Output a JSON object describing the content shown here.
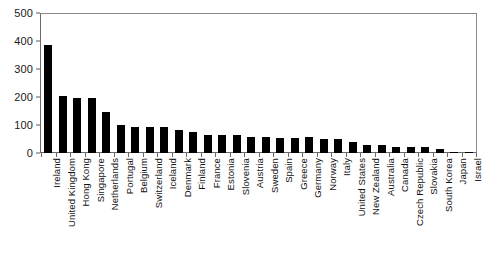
{
  "chart_data": {
    "type": "bar",
    "title": "",
    "xlabel": "",
    "ylabel": "",
    "ylim": [
      0,
      500
    ],
    "yticks": [
      0,
      100,
      200,
      300,
      400,
      500
    ],
    "grid": false,
    "legend": null,
    "orientation": "vertical",
    "bar_color": "#000000",
    "categories": [
      "Ireland",
      "United Kingdom",
      "Hong Kong",
      "Singapore",
      "Netherlands",
      "Portugal",
      "Belgium",
      "Switzerland",
      "Iceland",
      "Denmark",
      "Finland",
      "France",
      "Estonia",
      "Slovenia",
      "Austria",
      "Sweden",
      "Spain",
      "Greece",
      "Germany",
      "Norway",
      "Italy",
      "United States",
      "New Zealand",
      "Australia",
      "Canada",
      "Czech Republic",
      "Slovakia",
      "South Korea",
      "Japan",
      "Israel"
    ],
    "values": [
      385,
      205,
      197,
      197,
      148,
      99,
      92,
      92,
      92,
      83,
      76,
      66,
      66,
      66,
      58,
      56,
      53,
      55,
      56,
      50,
      49,
      40,
      30,
      30,
      22,
      22,
      22,
      13,
      4,
      3
    ]
  }
}
